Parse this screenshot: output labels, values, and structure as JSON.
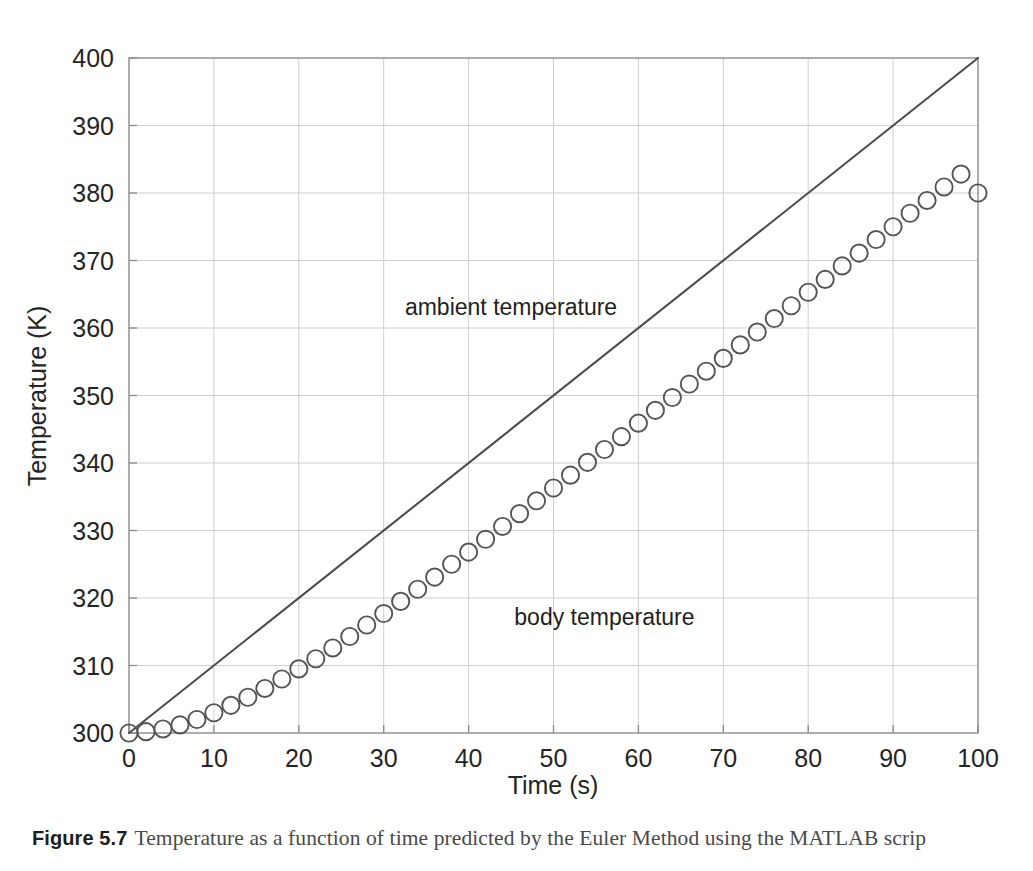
{
  "figure": {
    "caption_label": "Figure 5.7",
    "caption_text": "Temperature as a function of time predicted by the Euler Method using the MATLAB scrip"
  },
  "colors": {
    "ambient_line": "#4d4d4d",
    "body_marker": "#555555",
    "grid": "#cfcfcf",
    "axis": "#8a8a8a",
    "text": "#252525",
    "background": "#ffffff"
  },
  "chart_data": {
    "type": "line",
    "title": "",
    "xlabel": "Time (s)",
    "ylabel": "Temperature (K)",
    "xlim": [
      0,
      100
    ],
    "ylim": [
      300,
      400
    ],
    "xticks": [
      0,
      10,
      20,
      30,
      40,
      50,
      60,
      70,
      80,
      90,
      100
    ],
    "yticks": [
      300,
      310,
      320,
      330,
      340,
      350,
      360,
      370,
      380,
      390,
      400
    ],
    "grid": true,
    "legend_position": "inline-annotations",
    "annotations": [
      {
        "text": "ambient temperature",
        "x": 45,
        "y": 362
      },
      {
        "text": "body temperature",
        "x": 56,
        "y": 316
      }
    ],
    "series": [
      {
        "name": "ambient temperature",
        "style": "line",
        "marker": "none",
        "x": [
          0,
          100
        ],
        "values": [
          300,
          400
        ]
      },
      {
        "name": "body temperature",
        "style": "markers",
        "marker": "open-circle",
        "x": [
          0,
          2,
          4,
          6,
          8,
          10,
          12,
          14,
          16,
          18,
          20,
          22,
          24,
          26,
          28,
          30,
          32,
          34,
          36,
          38,
          40,
          42,
          44,
          46,
          48,
          50,
          52,
          54,
          56,
          58,
          60,
          62,
          64,
          66,
          68,
          70,
          72,
          74,
          76,
          78,
          80,
          82,
          84,
          86,
          88,
          90,
          92,
          94,
          96,
          98,
          100
        ],
        "values": [
          300.0,
          300.2,
          300.6,
          301.2,
          302.0,
          303.0,
          304.1,
          305.3,
          306.6,
          308.0,
          309.5,
          311.0,
          312.6,
          314.3,
          316.0,
          317.7,
          319.5,
          321.3,
          323.1,
          325.0,
          326.8,
          328.7,
          330.6,
          332.5,
          334.4,
          336.3,
          338.2,
          340.1,
          342.0,
          343.9,
          345.9,
          347.8,
          349.7,
          351.7,
          353.6,
          355.5,
          357.5,
          359.4,
          361.4,
          363.3,
          365.3,
          367.2,
          369.2,
          371.1,
          373.1,
          375.0,
          377.0,
          378.9,
          380.9,
          382.8,
          380.0
        ]
      }
    ]
  }
}
